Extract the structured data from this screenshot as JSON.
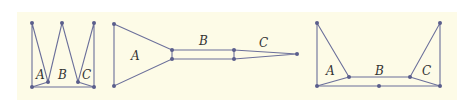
{
  "figures": [
    {
      "name": "figure-1-zigzag",
      "labels": [
        {
          "text": "A",
          "x": 36,
          "y": 79
        },
        {
          "text": "B",
          "x": 58,
          "y": 79
        },
        {
          "text": "C",
          "x": 82,
          "y": 79
        }
      ]
    },
    {
      "name": "figure-2-funnel",
      "labels": [
        {
          "text": "A",
          "x": 131,
          "y": 60
        },
        {
          "text": "B",
          "x": 199,
          "y": 45
        },
        {
          "text": "C",
          "x": 259,
          "y": 47
        }
      ]
    },
    {
      "name": "figure-3-trough",
      "labels": [
        {
          "text": "A",
          "x": 326,
          "y": 75
        },
        {
          "text": "B",
          "x": 375,
          "y": 75
        },
        {
          "text": "C",
          "x": 422,
          "y": 75
        }
      ]
    }
  ],
  "colors": {
    "background": "#fdfbe7",
    "edge": "#6b6f9a",
    "node": "#5a5e8c"
  }
}
